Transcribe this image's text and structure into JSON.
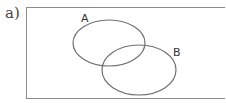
{
  "part_label": "a)",
  "diagram": {
    "type": "venn",
    "universe": {
      "x": 26,
      "y": 7,
      "width": 200,
      "height": 92,
      "stroke": "#777777"
    },
    "sets": [
      {
        "name": "A",
        "cx": 109,
        "cy": 43,
        "rx": 36,
        "ry": 23,
        "label_x": 81,
        "label_y": 19
      },
      {
        "name": "B",
        "cx": 139,
        "cy": 70,
        "rx": 37,
        "ry": 25,
        "label_x": 173,
        "label_y": 55
      }
    ],
    "stroke_color": "#707070"
  }
}
